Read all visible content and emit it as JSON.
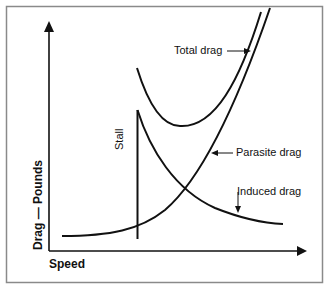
{
  "diagram": {
    "x_axis_label": "Speed",
    "y_axis_label": "Drag — Pounds",
    "annotations": {
      "total_drag": "Total drag",
      "parasite_drag": "Parasite drag",
      "induced_drag": "Induced drag",
      "stall": "Stall"
    },
    "colors": {
      "line": "#111111",
      "frame": "#8a8a8a"
    }
  }
}
